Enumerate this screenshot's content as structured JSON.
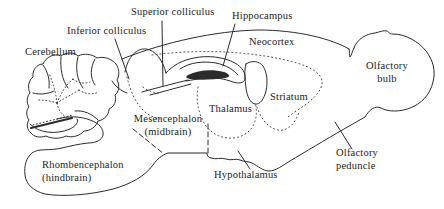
{
  "colors": {
    "ink": "#2b2b2b",
    "text": "#1c1c1c",
    "background": "#ffffff"
  },
  "labels": {
    "superior_colliculus": {
      "text": "Superior colliculus"
    },
    "inferior_colliculus": {
      "text": "Inferior colliculus"
    },
    "cerebellum": {
      "text": "Cerebellum"
    },
    "hippocampus": {
      "text": "Hippocampus"
    },
    "neocortex": {
      "text": "Neocortex"
    },
    "olfactory_bulb": {
      "line1": "Olfactory",
      "line2": "bulb"
    },
    "striatum": {
      "text": "Striatum"
    },
    "thalamus": {
      "text": "Thalamus"
    },
    "mesencephalon": {
      "line1": "Mesencephalon",
      "line2": "(midbrain)"
    },
    "rhombencephalon": {
      "line1": "Rhombencephalon",
      "line2": "(hindbrain)"
    },
    "hypothalamus": {
      "text": "Hypothalamus"
    },
    "olfactory_peduncle": {
      "line1": "Olfactory",
      "line2": "peduncle"
    }
  }
}
